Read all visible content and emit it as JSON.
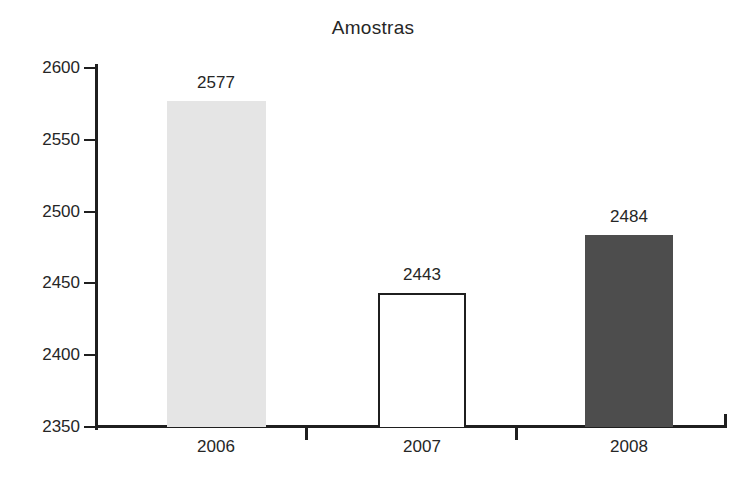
{
  "chart_data": {
    "type": "bar",
    "title": "Amostras",
    "xlabel": "",
    "ylabel": "",
    "categories": [
      "2006",
      "2007",
      "2008"
    ],
    "values": [
      2577,
      2443,
      2484
    ],
    "value_labels": [
      "2577",
      "2443",
      "2484"
    ],
    "ylim": [
      2350,
      2600
    ],
    "yticks": [
      2600,
      2550,
      2500,
      2450,
      2400,
      2350
    ],
    "ytick_labels": [
      "2600",
      "2550",
      "2500",
      "2450",
      "2400",
      "2350"
    ],
    "grid": false,
    "legend": null,
    "bar_styles": [
      {
        "fill": "#e5e5e5",
        "stroke": "#e5e5e5"
      },
      {
        "fill": "#ffffff",
        "stroke": "#1f1f1f"
      },
      {
        "fill": "#4d4d4d",
        "stroke": "#4d4d4d"
      }
    ],
    "axis_color": "#1f1f1f",
    "text_color": "#262626",
    "background": "#ffffff"
  }
}
